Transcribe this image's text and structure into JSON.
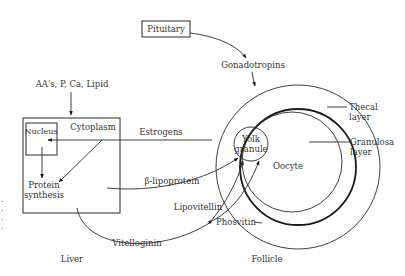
{
  "diagram": {
    "nodes": {
      "pituitary": "Pituitary",
      "gonadotropins": "Gonadotropins",
      "inputs": "AA's, P, Ca, Lipid",
      "nucleus": "Nucleus",
      "cytoplasm": "Cytoplasm",
      "protein_synthesis_1": "Protein",
      "protein_synthesis_2": "synthesis",
      "liver": "Liver",
      "follicle": "Follicle",
      "thecal_layer_1": "Thecal",
      "thecal_layer_2": "layer",
      "granulosa_layer_1": "Granulosa",
      "granulosa_layer_2": "layer",
      "oocyte": "Oocyte",
      "yolk_granule_1": "Yolk",
      "yolk_granule_2": "granule"
    },
    "edges": {
      "estrogens": "Estrogens",
      "beta_lipoprotein": "β-lipoprotein",
      "lipovitellin": "Lipovitellin",
      "phosvitin": "Phosvitin",
      "vitelloginin": "Vitelloginin"
    },
    "colors": {
      "line": "#2a2a2a",
      "text": "#333333",
      "background": "#ffffff"
    }
  }
}
